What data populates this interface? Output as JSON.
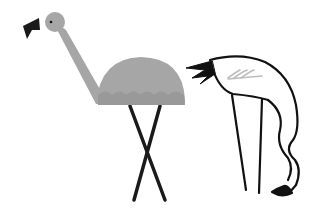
{
  "scene": {
    "description": "Illustration of two flamingos",
    "background": "#ffffff",
    "figures": [
      {
        "name": "gray-flamingo",
        "style": "filled",
        "body_color": "#a6a6a6",
        "underside_color": "#999999",
        "beak_color": "#1a1a1a"
      },
      {
        "name": "outline-flamingo",
        "style": "line-drawing",
        "stroke_color": "#111111",
        "fill": "#ffffff",
        "wing_mark_color": "#bdbdbd",
        "tail_color": "#111111"
      }
    ]
  }
}
